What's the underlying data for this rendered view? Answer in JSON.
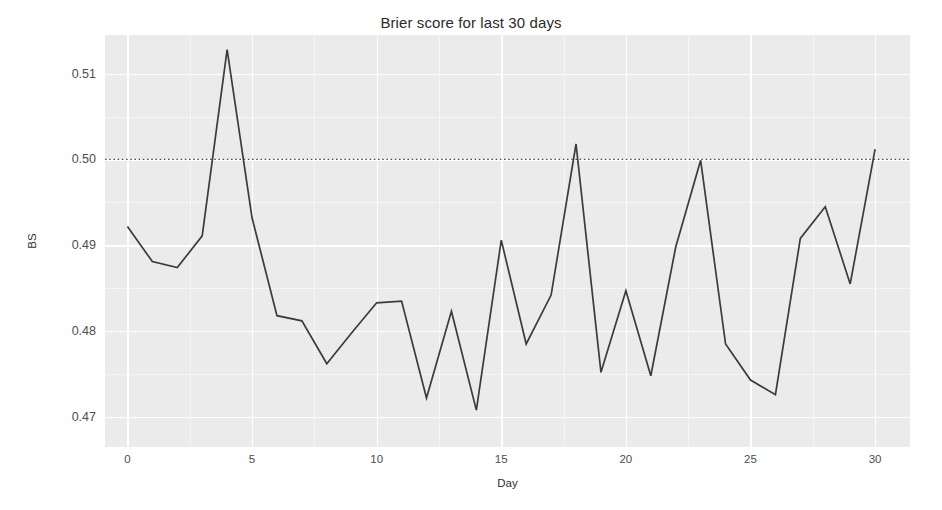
{
  "chart_data": {
    "type": "line",
    "title": "Brier score for last 30 days",
    "xlabel": "Day",
    "ylabel": "BS",
    "xlim": [
      -0.9,
      31.4
    ],
    "ylim": [
      0.4665,
      0.5145
    ],
    "grid": true,
    "legend": false,
    "x": [
      0,
      1,
      2,
      3,
      4,
      5,
      6,
      7,
      8,
      9,
      10,
      11,
      12,
      13,
      14,
      15,
      16,
      17,
      18,
      19,
      20,
      21,
      22,
      23,
      24,
      25,
      26,
      27,
      28,
      29,
      30
    ],
    "values": [
      0.4922,
      0.4881,
      0.4874,
      0.4911,
      0.5128,
      0.4932,
      0.4818,
      0.4812,
      0.4762,
      0.4798,
      0.4833,
      0.4835,
      0.4722,
      0.4823,
      0.4708,
      0.4906,
      0.4785,
      0.4842,
      0.5018,
      0.4752,
      0.4847,
      0.4748,
      0.4898,
      0.4999,
      0.4785,
      0.4743,
      0.4726,
      0.4908,
      0.4945,
      0.4855,
      0.5012
    ],
    "series_name": "Brier score",
    "series_color": "#3b3b3b",
    "reference_line": {
      "label": "0.50 reference",
      "value": 0.5,
      "style": "dotted",
      "color": "#4d4d4d"
    },
    "x_ticks": [
      {
        "value": 0,
        "label": "0"
      },
      {
        "value": 5,
        "label": "5"
      },
      {
        "value": 10,
        "label": "10"
      },
      {
        "value": 15,
        "label": "15"
      },
      {
        "value": 20,
        "label": "20"
      },
      {
        "value": 25,
        "label": "25"
      },
      {
        "value": 30,
        "label": "30"
      }
    ],
    "x_minor_ticks": [
      2.5,
      7.5,
      12.5,
      17.5,
      22.5,
      27.5
    ],
    "y_ticks": [
      {
        "value": 0.47,
        "label": "0.47"
      },
      {
        "value": 0.48,
        "label": "0.48"
      },
      {
        "value": 0.49,
        "label": "0.49"
      },
      {
        "value": 0.5,
        "label": "0.50"
      },
      {
        "value": 0.51,
        "label": "0.51"
      }
    ],
    "y_minor_ticks": [
      0.475,
      0.485,
      0.495,
      0.505
    ],
    "panel_background": "#ebebeb",
    "grid_major_color": "#ffffff",
    "grid_minor_color": "#f5f5f5",
    "figure_background": "#ffffff"
  }
}
